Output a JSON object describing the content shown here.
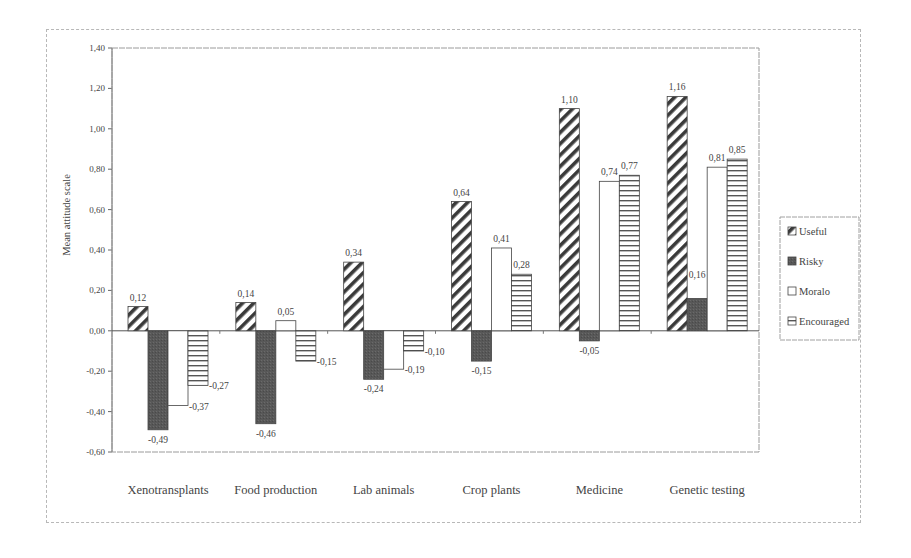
{
  "chart_data": {
    "type": "bar",
    "title": "",
    "xlabel": "",
    "ylabel": "Mean attitude scale",
    "ylim": [
      -0.6,
      1.4
    ],
    "yticks": [
      "1,40",
      "1,20",
      "1,00",
      "0,80",
      "0,60",
      "0,40",
      "0,20",
      "0,00",
      "-0,20",
      "-0,40",
      "-0,60"
    ],
    "ytick_values": [
      1.4,
      1.2,
      1.0,
      0.8,
      0.6,
      0.4,
      0.2,
      0.0,
      -0.2,
      -0.4,
      -0.6
    ],
    "grid": false,
    "legend_position": "right",
    "categories": [
      "Xenotransplants",
      "Food production",
      "Lab animals",
      "Crop plants",
      "Medicine",
      "Genetic testing"
    ],
    "series": [
      {
        "name": "Useful",
        "pattern": "diagonal-hatch",
        "values": [
          0.12,
          0.14,
          0.34,
          0.64,
          1.1,
          1.16
        ],
        "labels": [
          "0,12",
          "0,14",
          "0,34",
          "0,64",
          "1,10",
          "1,16"
        ]
      },
      {
        "name": "Risky",
        "pattern": "solid-dark",
        "values": [
          -0.49,
          -0.46,
          -0.24,
          -0.15,
          -0.05,
          0.16
        ],
        "labels": [
          "-0,49",
          "-0,46",
          "-0,24",
          "-0,15",
          "-0,05",
          "0,16"
        ]
      },
      {
        "name": "Moralo",
        "pattern": "hollow",
        "values": [
          -0.37,
          0.05,
          -0.19,
          0.41,
          0.74,
          0.81
        ],
        "labels": [
          "-0,37",
          "0,05",
          "-0,19",
          "0,41",
          "0,74",
          "0,81"
        ]
      },
      {
        "name": "Encouraged",
        "pattern": "horizontal-stripes",
        "values": [
          -0.27,
          -0.15,
          -0.1,
          0.28,
          0.77,
          0.85
        ],
        "labels": [
          "-0,27",
          "-0,15",
          "-0,10",
          "0,28",
          "0,77",
          "0,85"
        ]
      }
    ]
  },
  "colors": {
    "ink": "#444444",
    "risky_fill": "#555555",
    "frame": "#b8b8b8"
  }
}
